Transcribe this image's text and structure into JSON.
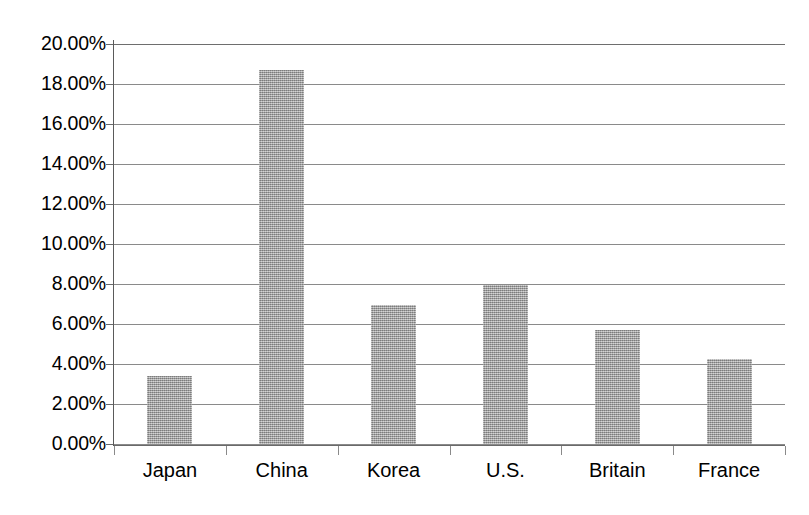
{
  "chart_data": {
    "type": "bar",
    "title": "",
    "xlabel": "",
    "ylabel": "",
    "categories": [
      "Japan",
      "China",
      "Korea",
      "U.S.",
      "Britain",
      "France"
    ],
    "values": [
      3.4,
      18.7,
      6.95,
      7.95,
      5.7,
      4.25
    ],
    "value_unit": "percent",
    "ylim": [
      0,
      20
    ],
    "ytick_step": 2,
    "ytick_labels": [
      "0.00%",
      "2.00%",
      "4.00%",
      "6.00%",
      "8.00%",
      "10.00%",
      "12.00%",
      "14.00%",
      "16.00%",
      "18.00%",
      "20.00%"
    ],
    "ytick_values": [
      0,
      2,
      4,
      6,
      8,
      10,
      12,
      14,
      16,
      18,
      20
    ],
    "grid": true,
    "grid_axis": "y",
    "legend": false,
    "legend_position": "none",
    "series": [
      {
        "name": "",
        "color": "#9b9b9b",
        "values": [
          3.4,
          18.7,
          6.95,
          7.95,
          5.7,
          4.25
        ]
      }
    ]
  },
  "caption": {
    "text": ""
  }
}
